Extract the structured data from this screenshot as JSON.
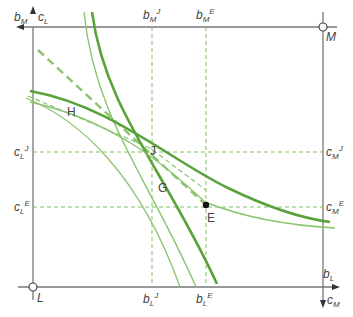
{
  "diagram": {
    "type": "edgeworth-box",
    "colors": {
      "axis": "#777777",
      "curve_dark": "#5aa33a",
      "curve_light": "#8cc46e",
      "dashed": "#7fbf5f",
      "point": "#111111",
      "text": "#444444"
    },
    "origins": {
      "L": {
        "label": "L"
      },
      "M": {
        "label": "M"
      }
    },
    "axis_labels": {
      "top_left_vertical": {
        "base": "c",
        "sub": "L",
        "sup": ""
      },
      "top_left_horizontal": {
        "base": "b",
        "sub": "M",
        "sup": ""
      },
      "bottom_right_horizontal": {
        "base": "b",
        "sub": "L",
        "sup": ""
      },
      "bottom_right_vertical": {
        "base": "c",
        "sub": "M",
        "sup": ""
      }
    },
    "tick_labels": {
      "top": [
        {
          "base": "b",
          "sub": "M",
          "sup": "J"
        },
        {
          "base": "b",
          "sub": "M",
          "sup": "E"
        }
      ],
      "bottom": [
        {
          "base": "b",
          "sub": "L",
          "sup": "J"
        },
        {
          "base": "b",
          "sub": "L",
          "sup": "E"
        }
      ],
      "left": [
        {
          "base": "c",
          "sub": "L",
          "sup": "J"
        },
        {
          "base": "c",
          "sub": "L",
          "sup": "E"
        }
      ],
      "right": [
        {
          "base": "c",
          "sub": "M",
          "sup": "J"
        },
        {
          "base": "c",
          "sub": "M",
          "sup": "E"
        }
      ]
    },
    "points": {
      "H": "H",
      "J": "J",
      "G": "G",
      "E": "E"
    }
  }
}
